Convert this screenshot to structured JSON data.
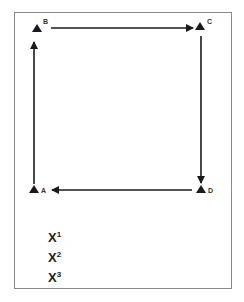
{
  "diagram": {
    "nodes": [
      {
        "id": "A",
        "label": "A"
      },
      {
        "id": "B",
        "label": "B"
      },
      {
        "id": "C",
        "label": "C"
      },
      {
        "id": "D",
        "label": "D"
      }
    ],
    "edges": [
      {
        "from": "A",
        "to": "B"
      },
      {
        "from": "B",
        "to": "C"
      },
      {
        "from": "C",
        "to": "D"
      },
      {
        "from": "D",
        "to": "A"
      }
    ],
    "legend": [
      {
        "base": "X",
        "sup": "1"
      },
      {
        "base": "X",
        "sup": "2"
      },
      {
        "base": "X",
        "sup": "3"
      }
    ],
    "colors": {
      "stroke": "#1a1a1a",
      "frame": "#8a8a8a"
    }
  }
}
